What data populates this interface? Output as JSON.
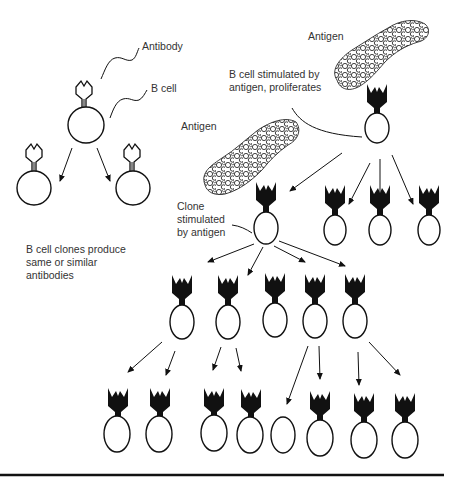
{
  "labels": {
    "antibody": "Antibody",
    "b_cell": "B cell",
    "clones_line1": "B cell clones produce",
    "clones_line2": "same or similar",
    "clones_line3": "antibodies",
    "antigen_top": "Antigen",
    "antigen_mid": "Antigen",
    "stimulated_line1": "B cell stimulated by",
    "stimulated_line2": "antigen, proliferates",
    "clone_line1": "Clone",
    "clone_line2": "stimulated",
    "clone_line3": "by antigen"
  },
  "colors": {
    "ink": "#111111",
    "text": "#333333",
    "background": "#ffffff"
  },
  "figure": {
    "left_panel": {
      "parent_cell": {
        "cx": 86,
        "cy": 125,
        "r": 18
      },
      "clones": [
        {
          "cx": 34,
          "cy": 188,
          "r": 17
        },
        {
          "cx": 135,
          "cy": 188,
          "r": 17
        }
      ]
    },
    "right_panel": {
      "stimulated_cell": {
        "cx": 377,
        "cy": 125
      },
      "row1": [
        266,
        332,
        379,
        429
      ],
      "row2": [
        182,
        229,
        277,
        318,
        357
      ],
      "row3": [
        118,
        160,
        216,
        254,
        281,
        322,
        365,
        407
      ],
      "row3_without_antibody_index": 4
    }
  }
}
